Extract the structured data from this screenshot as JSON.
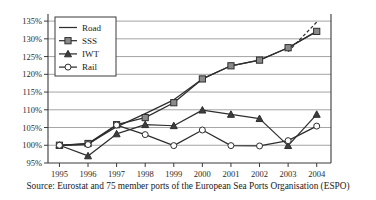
{
  "chart_data": {
    "type": "line",
    "title": "",
    "xlabel": "",
    "ylabel": "",
    "x": [
      1995,
      1996,
      1997,
      1998,
      1999,
      2000,
      2001,
      2002,
      2003,
      2004
    ],
    "categories": [
      "1995",
      "1996",
      "1997",
      "1998",
      "1999",
      "2000",
      "2001",
      "2002",
      "2003",
      "2004"
    ],
    "ylim": [
      95,
      137
    ],
    "xlim": [
      1994.6,
      2004.5
    ],
    "ytick_values": [
      95,
      100,
      105,
      110,
      115,
      120,
      125,
      130,
      135
    ],
    "ytick_labels": [
      "95%",
      "100%",
      "105%",
      "110%",
      "115%",
      "120%",
      "125%",
      "130%",
      "135%"
    ],
    "grid": true,
    "grid_axis": "y",
    "legend_position": "top-left",
    "units": "index, 1995 = 100%",
    "series": [
      {
        "name": "Road",
        "marker": "none",
        "linestyle": "solid",
        "values": [
          100,
          100.4,
          105.2,
          108.9,
          112.8,
          118.7,
          122.4,
          124.0,
          127.5,
          132.1
        ],
        "dashed_segment": {
          "from_year": 2003,
          "to_year": 2004,
          "from_value": 126.4,
          "to_value": 134.7,
          "note": "dashed projection branch rising above the SSS line"
        }
      },
      {
        "name": "SSS",
        "marker": "square",
        "linestyle": "solid",
        "values": [
          100,
          100.5,
          105.8,
          107.8,
          112.0,
          118.7,
          122.4,
          124.0,
          127.5,
          132.1
        ]
      },
      {
        "name": "IWT",
        "marker": "triangle",
        "linestyle": "solid",
        "values": [
          100,
          97.0,
          103.2,
          105.8,
          105.5,
          109.9,
          108.7,
          107.5,
          99.9,
          108.7
        ]
      },
      {
        "name": "Rail",
        "marker": "circle",
        "linestyle": "solid",
        "values": [
          100,
          100.2,
          105.7,
          103.0,
          99.9,
          104.3,
          99.9,
          99.8,
          101.3,
          105.4
        ]
      }
    ]
  },
  "legend": {
    "entries": [
      {
        "label": "Road",
        "marker": "none"
      },
      {
        "label": "SSS",
        "marker": "square"
      },
      {
        "label": "IWT",
        "marker": "triangle"
      },
      {
        "label": "Rail",
        "marker": "circle"
      }
    ]
  },
  "caption": {
    "text": "Source: Eurostat and 75 member ports of the European Sea Ports Organisation (ESPO)"
  },
  "colors": {
    "line": "#2e2e2e",
    "grid": "#8d8d8d",
    "axis": "#3a3a3a",
    "square_fill": "#8a8a8a",
    "triangle_fill": "#3d3d3d",
    "circle_fill": "#ffffff",
    "background": "#ffffff",
    "text": "#1a1a1a"
  }
}
